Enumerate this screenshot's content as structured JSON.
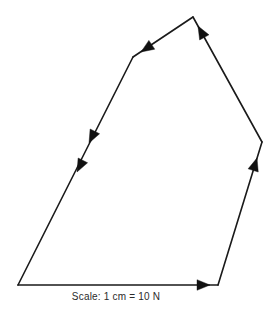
{
  "figure": {
    "type": "vector-polygon",
    "background_color": "#ffffff",
    "line_color": "#1a1a1a",
    "arrow_color": "#111111",
    "caption": "Scale: 1 cm = 10 N",
    "caption_color": "#2b2b2b"
  },
  "chart_data": {
    "type": "diagram",
    "title": "",
    "subtitle": "",
    "xlabel": "",
    "ylabel": "",
    "grid": false,
    "legend": null,
    "annotations": [
      {
        "name": "scale-note",
        "text": "Scale: 1 cm = 10 N",
        "x": 115,
        "y": 297
      }
    ],
    "scale": {
      "length_cm": 1,
      "equals_value": 10,
      "unit": "N",
      "label": "Scale: 1 cm = 10 N"
    },
    "vertices": [
      {
        "name": "bottom-left",
        "x": 18,
        "y": 285
      },
      {
        "name": "bottom-right",
        "x": 218,
        "y": 285
      },
      {
        "name": "right-bend",
        "x": 262,
        "y": 142
      },
      {
        "name": "apex-top",
        "x": 193,
        "y": 17
      },
      {
        "name": "upper-left-bend",
        "x": 133,
        "y": 57
      }
    ],
    "segments": [
      {
        "name": "bottom-edge",
        "from": [
          18,
          285
        ],
        "to": [
          218,
          285
        ],
        "direction": "right",
        "arrow_count": 1
      },
      {
        "name": "lower-right-edge",
        "from": [
          218,
          285
        ],
        "to": [
          262,
          142
        ],
        "direction": "up-right",
        "arrow_count": 1
      },
      {
        "name": "upper-right-edge",
        "from": [
          262,
          142
        ],
        "to": [
          193,
          17
        ],
        "direction": "up-left",
        "arrow_count": 1
      },
      {
        "name": "top-edge",
        "from": [
          193,
          17
        ],
        "to": [
          133,
          57
        ],
        "direction": "down-left",
        "arrow_count": 1
      },
      {
        "name": "left-edge",
        "from": [
          133,
          57
        ],
        "to": [
          18,
          285
        ],
        "direction": "down-left",
        "arrow_count": 2
      }
    ],
    "arrow_markers": [
      {
        "name": "bottom-edge-arrow",
        "x": 210,
        "y": 285,
        "angle_deg": 0
      },
      {
        "name": "lower-right-edge-arrow",
        "x": 257,
        "y": 158,
        "angle_deg": -72.9
      },
      {
        "name": "upper-right-edge-arrow",
        "x": 198,
        "y": 26,
        "angle_deg": -118.9
      },
      {
        "name": "top-edge-arrow",
        "x": 141,
        "y": 52,
        "angle_deg": 146.3
      },
      {
        "name": "left-edge-arrow-upper",
        "x": 89,
        "y": 143,
        "angle_deg": 116.8
      },
      {
        "name": "left-edge-arrow-lower",
        "x": 77,
        "y": 172,
        "angle_deg": 116.8
      }
    ]
  }
}
